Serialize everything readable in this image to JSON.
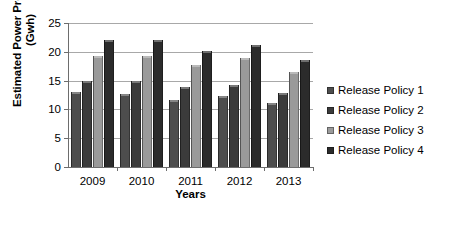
{
  "chart_data": {
    "type": "bar",
    "title": "",
    "xlabel": "Years",
    "ylabel": "Estimated Power Production (Gwh)",
    "ylabel_line1": "Estimated Power Production",
    "ylabel_line2": "(Gwh)",
    "categories": [
      "2009",
      "2010",
      "2011",
      "2012",
      "2013"
    ],
    "yticks": [
      "0",
      "5",
      "10",
      "15",
      "20",
      "25"
    ],
    "ylim": [
      0,
      25
    ],
    "grid": true,
    "legend_position": "right",
    "series": [
      {
        "name": "Release Policy 1",
        "color": "#4d4d4d",
        "values": [
          13.0,
          12.6,
          11.7,
          12.3,
          11.1
        ]
      },
      {
        "name": "Release Policy 2",
        "color": "#3b3b3b",
        "values": [
          15.0,
          15.0,
          13.9,
          14.3,
          12.8
        ]
      },
      {
        "name": "Release Policy 3",
        "color": "#9a9a9a",
        "values": [
          19.2,
          19.2,
          17.7,
          18.9,
          16.5
        ]
      },
      {
        "name": "Release Policy 4",
        "color": "#2b2b2b",
        "values": [
          22.0,
          22.0,
          20.2,
          21.2,
          18.6
        ]
      }
    ]
  },
  "legend": {
    "items": [
      {
        "label": "Release Policy 1"
      },
      {
        "label": "Release Policy 2"
      },
      {
        "label": "Release Policy 3"
      },
      {
        "label": "Release Policy 4"
      }
    ]
  }
}
